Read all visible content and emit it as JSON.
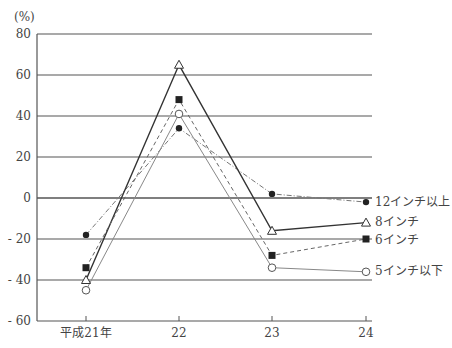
{
  "chart_data": {
    "type": "line",
    "title": "",
    "ylabel": "(%)",
    "xlabel": "",
    "ylim": [
      -60,
      80
    ],
    "yticks": [
      80,
      60,
      40,
      20,
      0,
      -20,
      -40,
      -60
    ],
    "ytick_labels": [
      "80",
      "60",
      "40",
      "20",
      "0",
      "- 20",
      "- 40",
      "- 60"
    ],
    "categories": [
      "平成21年",
      "22",
      "23",
      "24"
    ],
    "grid": true,
    "legend_position": "right (end of lines)",
    "series": [
      {
        "name": "12インチ以上",
        "values": [
          -18,
          34,
          2,
          -2
        ],
        "marker": "filled-circle",
        "line": "dashdot"
      },
      {
        "name": "8インチ",
        "values": [
          -40,
          65,
          -16,
          -12
        ],
        "marker": "open-triangle",
        "line": "solid"
      },
      {
        "name": "6インチ",
        "values": [
          -34,
          48,
          -28,
          -20
        ],
        "marker": "filled-square",
        "line": "dashed"
      },
      {
        "name": "5インチ以下",
        "values": [
          -45,
          41,
          -34,
          -36
        ],
        "marker": "open-circle",
        "line": "thin-solid"
      }
    ]
  },
  "labels": {
    "unit": "(%)",
    "y": [
      "80",
      "60",
      "40",
      "20",
      "0",
      "- 20",
      "- 40",
      "- 60"
    ],
    "x": [
      "平成21年",
      "22",
      "23",
      "24"
    ],
    "legend": [
      "12インチ以上",
      "8インチ",
      "6インチ",
      "5インチ以下"
    ]
  }
}
